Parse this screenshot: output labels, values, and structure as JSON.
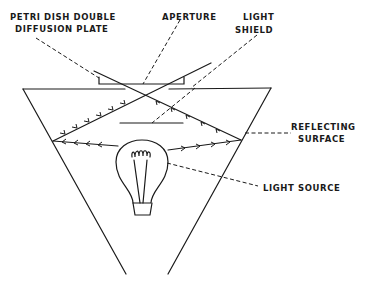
{
  "diagram": {
    "type": "optical-schematic",
    "labels": {
      "petri_dish_line1": "PETRI DISH DOUBLE",
      "petri_dish_line2": "DIFFUSION PLATE",
      "aperture": "APERTURE",
      "light_shield_line1": "LIGHT",
      "light_shield_line2": "SHIELD",
      "reflecting_line1": "REFLECTING",
      "reflecting_line2": "SURFACE",
      "light_source": "LIGHT SOURCE"
    },
    "components": [
      "petri-dish-double-diffusion-plate",
      "aperture",
      "light-shield",
      "reflecting-surface",
      "light-source"
    ],
    "colors": {
      "ink": "#1a1a1a",
      "background": "#ffffff"
    }
  }
}
